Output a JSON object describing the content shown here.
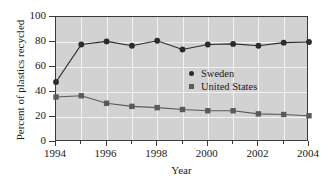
{
  "chart_data": {
    "type": "line",
    "title": "",
    "xlabel": "Year",
    "ylabel": "Percent of plastics recycled",
    "x": [
      1994,
      1995,
      1996,
      1997,
      1998,
      1999,
      2000,
      2001,
      2002,
      2003,
      2004
    ],
    "xlim": [
      1994,
      2004
    ],
    "ylim": [
      0,
      100
    ],
    "yticks": [
      0,
      20,
      40,
      60,
      80,
      100
    ],
    "xticks": [
      1994,
      1996,
      1998,
      2000,
      2002,
      2004
    ],
    "xticks_minor": [
      1995,
      1997,
      1999,
      2001,
      2003
    ],
    "grid": true,
    "legend_position": "center-right",
    "series": [
      {
        "name": "Sweden",
        "marker": "circle",
        "color": "#2b2b2b",
        "values": [
          48,
          78,
          80.5,
          77,
          81,
          74,
          78,
          78.5,
          77,
          79.5,
          80
        ]
      },
      {
        "name": "United States",
        "marker": "square",
        "color": "#5a5a5a",
        "values": [
          36,
          37,
          31,
          28.5,
          27.5,
          26,
          25,
          25,
          22.5,
          22,
          21
        ]
      }
    ]
  },
  "axes": {
    "ylabel": "Percent of plastics recycled",
    "xlabel": "Year",
    "ytick_labels": [
      "100",
      "80",
      "60",
      "40",
      "20",
      "0"
    ],
    "xtick_labels": [
      "1994",
      "1996",
      "1998",
      "2000",
      "2002",
      "2004"
    ]
  },
  "legend": {
    "items": [
      {
        "label": "Sweden",
        "marker": "circle"
      },
      {
        "label": "United States",
        "marker": "square"
      }
    ]
  },
  "colors": {
    "plot_background": "#d2d2d2",
    "gridline": "#f2f2f2",
    "frame": "#3a3a3a",
    "sweden": "#2b2b2b",
    "united_states": "#5a5a5a",
    "page_background": "#ffffff"
  }
}
